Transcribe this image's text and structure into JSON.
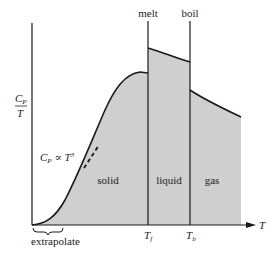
{
  "diagram": {
    "y_axis_label_numerator": "C",
    "y_axis_label_numerator_sub": "P",
    "y_axis_label_denominator": "T",
    "x_axis_label": "T",
    "phase_transitions": {
      "melt_label": "melt",
      "boil_label": "boil",
      "melt_tick_label": "T",
      "melt_tick_sub": "f",
      "boil_tick_label": "T",
      "boil_tick_sub": "b"
    },
    "regions": {
      "solid": "solid",
      "liquid": "liquid",
      "gas": "gas"
    },
    "annotations": {
      "low_t_law": "C",
      "low_t_law_sub": "P",
      "low_t_law_rest": " ∝ T",
      "low_t_law_exp": "3",
      "extrapolate": "extrapolate"
    },
    "colors": {
      "fill": "#cfcfcf",
      "line": "#1a1a1a"
    }
  }
}
